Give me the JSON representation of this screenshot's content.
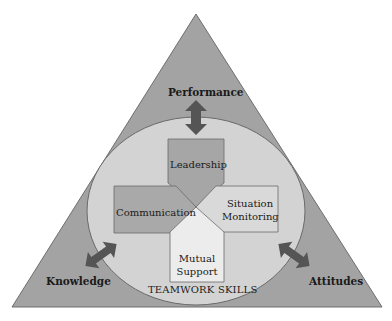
{
  "diagram": {
    "corners": {
      "top": "Performance",
      "left": "Knowledge",
      "right": "Attitudes"
    },
    "circle_label": "TEAMWORK SKILLS",
    "skills": {
      "top": "Leadership",
      "left": "Communication",
      "right_line1": "Situation",
      "right_line2": "Monitoring",
      "bottom_line1": "Mutual",
      "bottom_line2": "Support"
    },
    "colors": {
      "triangle": "#a3a3a3",
      "circle": "#d3d3d3",
      "arrow": "#555555",
      "leadership": "#a6a6a6",
      "communication": "#a9a9a9",
      "situation_monitoring": "#d9d9d9",
      "mutual_support": "#ececec"
    }
  }
}
